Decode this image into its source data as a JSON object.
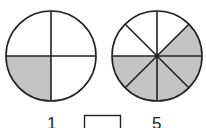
{
  "figure": {
    "circles": [
      {
        "name": "quarters-circle",
        "parts": 4,
        "shaded": 1,
        "center": [
          51,
          56
        ],
        "radius": 45
      },
      {
        "name": "eighths-circle",
        "parts": 8,
        "shaded": 5,
        "center": [
          157,
          56
        ],
        "radius": 45
      }
    ],
    "colors": {
      "stroke": "#222222",
      "shade": "#c4c4c4",
      "background": "#ffffff"
    }
  },
  "equation": {
    "left_numerator": "1",
    "box": "",
    "right_numerator": "5"
  }
}
